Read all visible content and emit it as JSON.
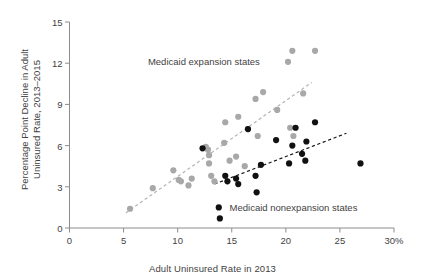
{
  "chart_data": {
    "type": "scatter",
    "title": "",
    "xlabel": "Adult Uninsured Rate in 2013",
    "ylabel": "Percentage Point Decline in Adult Uninsured Rate, 2013–2015",
    "ylabel_line1": "Percentage Point Decline in Adult",
    "ylabel_line2": "Uninsured Rate, 2013–2015",
    "xlim": [
      0,
      30
    ],
    "ylim": [
      0,
      15
    ],
    "xticks": [
      0,
      5,
      10,
      15,
      20,
      25,
      30
    ],
    "xtick_labels": [
      "0",
      "5",
      "10",
      "15",
      "20",
      "25",
      "30%"
    ],
    "yticks": [
      0,
      3,
      6,
      9,
      12,
      15
    ],
    "ytick_labels": [
      "0",
      "3",
      "6",
      "9",
      "12",
      "15"
    ],
    "grid": false,
    "legend_position": "inline-annotations",
    "series": [
      {
        "name": "Medicaid expansion states",
        "color": "#a8a8a8",
        "marker": "circle",
        "points": [
          [
            5.6,
            1.4
          ],
          [
            7.7,
            2.9
          ],
          [
            9.6,
            4.2
          ],
          [
            10.1,
            3.5
          ],
          [
            10.3,
            3.4
          ],
          [
            11.0,
            3.1
          ],
          [
            11.3,
            3.6
          ],
          [
            12.6,
            5.9
          ],
          [
            12.8,
            5.7
          ],
          [
            12.9,
            4.7
          ],
          [
            12.9,
            5.3
          ],
          [
            13.1,
            3.8
          ],
          [
            13.4,
            3.4
          ],
          [
            14.3,
            6.2
          ],
          [
            14.4,
            7.7
          ],
          [
            14.8,
            4.9
          ],
          [
            15.4,
            5.2
          ],
          [
            15.6,
            8.1
          ],
          [
            16.2,
            4.5
          ],
          [
            16.5,
            7.2
          ],
          [
            17.2,
            9.4
          ],
          [
            17.4,
            6.7
          ],
          [
            17.9,
            9.9
          ],
          [
            19.2,
            8.6
          ],
          [
            20.2,
            12.1
          ],
          [
            20.4,
            7.3
          ],
          [
            20.6,
            12.9
          ],
          [
            20.7,
            6.7
          ],
          [
            21.6,
            9.8
          ],
          [
            22.7,
            12.9
          ]
        ]
      },
      {
        "name": "Medicaid nonexpansion states",
        "color": "#111111",
        "marker": "circle",
        "points": [
          [
            12.3,
            5.8
          ],
          [
            13.8,
            1.5
          ],
          [
            13.9,
            0.7
          ],
          [
            14.4,
            3.8
          ],
          [
            14.6,
            3.4
          ],
          [
            15.4,
            3.6
          ],
          [
            15.6,
            3.2
          ],
          [
            16.5,
            7.2
          ],
          [
            17.2,
            3.8
          ],
          [
            17.3,
            2.6
          ],
          [
            17.7,
            4.6
          ],
          [
            19.1,
            6.4
          ],
          [
            20.3,
            4.7
          ],
          [
            20.6,
            6.0
          ],
          [
            20.9,
            7.3
          ],
          [
            21.5,
            5.4
          ],
          [
            21.8,
            4.9
          ],
          [
            21.9,
            6.3
          ],
          [
            22.7,
            7.7
          ],
          [
            26.9,
            4.7
          ]
        ]
      }
    ],
    "trendlines": [
      {
        "name": "expansion-trendline",
        "color": "#b5b5b5",
        "style": "dashed",
        "x0": 5.2,
        "y0": 1.1,
        "x1": 22.4,
        "y1": 10.6
      },
      {
        "name": "nonexpansion-trendline",
        "color": "#141414",
        "style": "dashed",
        "x0": 13.4,
        "y0": 3.2,
        "x1": 25.6,
        "y1": 6.9
      }
    ],
    "annotations": [
      {
        "name": "expansion-label",
        "text": "Medicaid expansion states",
        "marker_color": "#a8a8a8",
        "x": 17.6,
        "y": 12.05,
        "text_anchor": "end"
      },
      {
        "name": "nonexpansion-label",
        "text": "Medicaid nonexpansion states",
        "marker_color": "#111111",
        "x": 14.8,
        "y": 1.45,
        "text_anchor": "start"
      }
    ]
  }
}
